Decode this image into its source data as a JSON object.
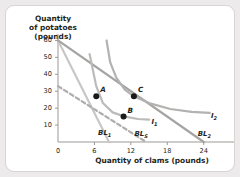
{
  "chart_data": {
    "type": "line",
    "title": "",
    "xlabel": "Quantity of clams (pounds)",
    "ylabel": "Quantity of potatoes (pounds)",
    "xlim": [
      0,
      28
    ],
    "ylim": [
      0,
      65
    ],
    "xticks": [
      0,
      6,
      12,
      18,
      24
    ],
    "yticks": [
      10,
      20,
      30,
      40,
      50,
      60
    ],
    "grid": false,
    "legend": "inline-curve-labels",
    "series": [
      {
        "name": "BL1",
        "label": "BL",
        "sub": "1",
        "kind": "budget-line",
        "style": "solid",
        "color": "#c9c7c5",
        "points": [
          [
            0,
            60
          ],
          [
            8.4,
            0
          ]
        ]
      },
      {
        "name": "BLS",
        "label": "BL",
        "sub": "S",
        "kind": "budget-line-compensated",
        "style": "dashed",
        "color": "#b0aeac",
        "points": [
          [
            0,
            33
          ],
          [
            14.5,
            0
          ]
        ]
      },
      {
        "name": "BL2",
        "label": "BL",
        "sub": "2",
        "kind": "budget-line",
        "style": "solid",
        "color": "#a6a4a2",
        "points": [
          [
            0,
            60
          ],
          [
            24,
            0
          ]
        ]
      },
      {
        "name": "I1",
        "label": "I",
        "sub": "1",
        "kind": "indifference-curve",
        "style": "solid",
        "color": "#bdbbb9",
        "points": [
          [
            5.2,
            52
          ],
          [
            6.3,
            33
          ],
          [
            7.4,
            23
          ],
          [
            9.0,
            17.5
          ],
          [
            11.0,
            15
          ],
          [
            13.2,
            13.6
          ],
          [
            15.0,
            13.2
          ]
        ]
      },
      {
        "name": "I2",
        "label": "I",
        "sub": "2",
        "kind": "indifference-curve",
        "style": "solid",
        "color": "#b4b2b0",
        "points": [
          [
            8.0,
            60
          ],
          [
            8.6,
            47
          ],
          [
            9.6,
            38
          ],
          [
            11.0,
            31
          ],
          [
            12.5,
            27
          ],
          [
            15.0,
            23
          ],
          [
            18.5,
            19.5
          ],
          [
            22.0,
            17.8
          ],
          [
            25.0,
            17.2
          ]
        ]
      }
    ],
    "points": [
      {
        "name": "A",
        "label": "A",
        "x": 6.3,
        "y": 27,
        "label_pos": "upper-right"
      },
      {
        "name": "B",
        "label": "B",
        "x": 10.8,
        "y": 15,
        "label_pos": "upper-right"
      },
      {
        "name": "C",
        "label": "C",
        "x": 12.5,
        "y": 27,
        "label_pos": "upper-right"
      }
    ],
    "axis_color": "#9b9997",
    "point_color": "#1a1a1a"
  }
}
